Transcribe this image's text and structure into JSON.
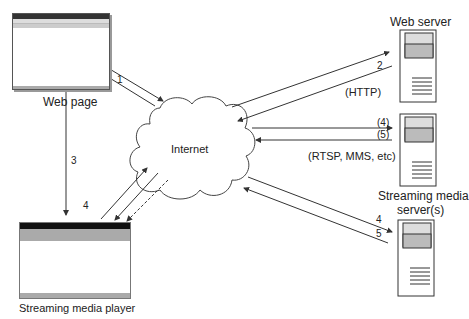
{
  "diagram": {
    "nodes": {
      "web_page": {
        "label": "Web page",
        "window_title": "Microsoft Internet Explorer",
        "menu": [
          "File",
          "Edit",
          "View",
          "Favorites",
          "Tools",
          "Help"
        ]
      },
      "internet": {
        "label": "Internet"
      },
      "web_server": {
        "label": "Web server",
        "protocol": "(HTTP)"
      },
      "streaming_server": {
        "label": "Streaming media server(s)",
        "label_line1": "Streaming media",
        "label_line2": "server(s)",
        "protocol": "(RTSP, MMS, etc)"
      },
      "player": {
        "label": "Streaming media player"
      }
    },
    "edges": [
      {
        "label": "1",
        "from": "web_page",
        "to": "internet"
      },
      {
        "label": "2",
        "from": "web_server",
        "to": "internet"
      },
      {
        "label": "3",
        "from": "web_page",
        "to": "player"
      },
      {
        "label": "4",
        "from": "player",
        "to": "internet"
      },
      {
        "label": "(4)",
        "from": "internet",
        "to": "streaming_server"
      },
      {
        "label": "(5)",
        "from": "streaming_server",
        "to": "internet"
      },
      {
        "label": "4",
        "from": "internet",
        "to": "streaming_server_2"
      },
      {
        "label": "5",
        "from": "streaming_server_2",
        "to": "internet"
      }
    ]
  }
}
